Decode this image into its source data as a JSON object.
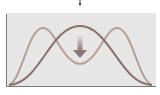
{
  "diagram": {
    "type": "distribution-shift",
    "colors": {
      "background": "#e6e6e6",
      "axis": "#7a7a7a",
      "unimodal_curve": "#8a6f6a",
      "bimodal_curve": "#b89f8e",
      "arrow": "#8a7570",
      "top_marker": "#333333"
    },
    "curves": [
      {
        "name": "unimodal",
        "peaks": 1
      },
      {
        "name": "bimodal",
        "peaks": 2
      }
    ],
    "arrow": {
      "direction": "down"
    }
  }
}
